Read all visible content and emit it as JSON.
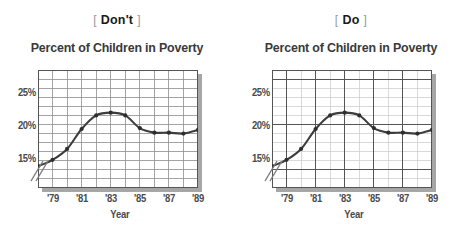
{
  "panels": [
    {
      "key": "dont",
      "caption_open": "[",
      "caption_word": "Don't",
      "caption_close": "]",
      "grid_style": "uniform-heavy"
    },
    {
      "key": "do",
      "caption_open": "[",
      "caption_word": "Do",
      "caption_close": "]",
      "grid_style": "major-minor"
    }
  ],
  "colors": {
    "line": "#3d3d3d",
    "marker": "#2e2e2e",
    "grid_heavy": "#8d8d8d",
    "grid_major": "#555555",
    "grid_minor": "#c9c9c9",
    "frame": "#555555",
    "shadow": "#a6a6a6",
    "text": "#3a3a3a",
    "bracket": "#9a9a9a",
    "background": "#ffffff"
  },
  "chart_data": {
    "type": "line",
    "title": "Percent of Children in Poverty",
    "xlabel": "Year",
    "ylabel": "",
    "grid": true,
    "legend": false,
    "axis_break": true,
    "ylim": [
      13,
      26
    ],
    "xlim": [
      1978,
      1989
    ],
    "ytick_labels": [
      "25%",
      "20%",
      "15%"
    ],
    "ytick_values": [
      25,
      20,
      15
    ],
    "yminor_step": 1,
    "xtick_labels": [
      "'79",
      "'81",
      "'83",
      "'85",
      "'87",
      "'89"
    ],
    "xtick_values": [
      1979,
      1981,
      1983,
      1985,
      1987,
      1989
    ],
    "xminor_step": 1,
    "x": [
      1978,
      1979,
      1980,
      1981,
      1982,
      1983,
      1984,
      1985,
      1986,
      1987,
      1988,
      1989
    ],
    "values": [
      15.4,
      16.1,
      17.3,
      19.5,
      21.0,
      21.3,
      21.0,
      19.6,
      19.1,
      19.1,
      19.0,
      19.4
    ],
    "series": [
      {
        "name": "Percent of Children in Poverty",
        "values": [
          15.4,
          16.1,
          17.3,
          19.5,
          21.0,
          21.3,
          21.0,
          19.6,
          19.1,
          19.1,
          19.0,
          19.4
        ]
      }
    ]
  }
}
